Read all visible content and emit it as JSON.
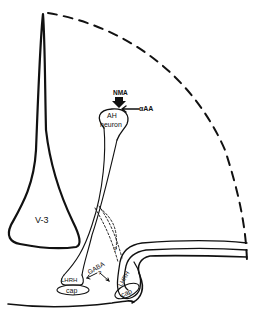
{
  "diagram": {
    "labels": {
      "nma": "NMA",
      "alpha_aa": "αAA",
      "ah_line1": "AH",
      "ah_line2": "neuron",
      "v3": "V-3",
      "gaba": "GABA",
      "question_gaba": "?",
      "question_top": "?",
      "lhrh_left": "LHRH",
      "lhrh_right": "LHRH",
      "cap_left": "cap",
      "cap_right": "cap"
    },
    "colors": {
      "ink": "#111111",
      "background": "#ffffff"
    }
  }
}
